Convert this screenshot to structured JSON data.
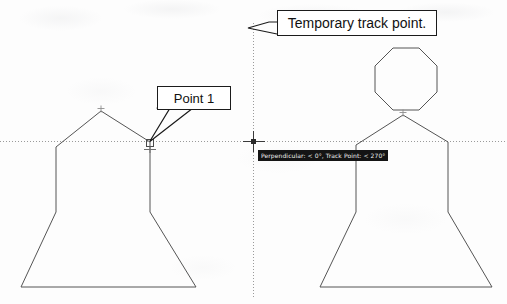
{
  "application": {
    "name": "cad-drawing-canvas",
    "background_color": "#fdfdfd",
    "line_color": "#555555",
    "tracking_line_color": "#9a9a9a"
  },
  "annotations": {
    "point1_callout": {
      "label": "Point 1",
      "box_color": "#ffffff",
      "border_color": "#1b1b1b"
    },
    "track_callout": {
      "label": "Temporary track point.",
      "box_color": "#ffffff",
      "border_color": "#1b1b1b"
    }
  },
  "snap_tooltip": {
    "text": "Perpendicular: < 0°, Track Point: < 270°",
    "background_color": "#141414",
    "text_color": "#f2f2f2"
  },
  "figures": {
    "left": {
      "name": "bell-figure-without-head",
      "apex_marker": "node-snap-marker",
      "perpendicular_marker": "perpendicular-snap-marker"
    },
    "right": {
      "name": "bell-figure-with-octagon-head",
      "head_shape": "octagon",
      "apex_marker": "node-snap-marker"
    }
  },
  "tracking": {
    "horizontal_line": "polar-tracking-horizontal",
    "vertical_line": "polar-tracking-vertical",
    "crosshair": "tracking-crosshair-marker"
  }
}
